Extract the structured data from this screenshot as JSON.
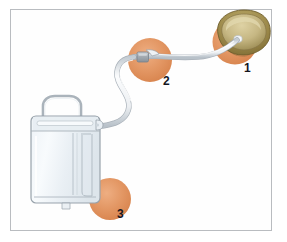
{
  "figure": {
    "background_color": "#ffffff",
    "frame_border_color": "#b9bcc0"
  },
  "labels": [
    {
      "id": "1",
      "text": "1",
      "refers_to": "bladder-with-catheter-balloon"
    },
    {
      "id": "2",
      "text": "2",
      "refers_to": "tubing-connector-clamp"
    },
    {
      "id": "3",
      "text": "3",
      "refers_to": "drainage-bag-outlet-valve"
    }
  ],
  "highlight_circles": [
    {
      "name": "highlight-circle-1",
      "color": "#e08e5c",
      "cx": 235,
      "cy": 42,
      "r": 22
    },
    {
      "name": "highlight-circle-2",
      "color": "#e08e5c",
      "cx": 150,
      "cy": 60,
      "r": 22
    },
    {
      "name": "highlight-circle-3",
      "color": "#e08e5c",
      "cx": 110,
      "cy": 199,
      "r": 21
    }
  ],
  "parts": {
    "bladder": {
      "name": "bladder-organ",
      "fill_outer": "#a08a4e",
      "fill_inner": "#cbbf8e",
      "outline": "#7c6a36"
    },
    "tubing": {
      "name": "drainage-tubing",
      "fill": "#f2f4f6",
      "outline": "#a9b0b7"
    },
    "connector": {
      "name": "tubing-connector-clamp",
      "fill": "#b6bcc2",
      "outline": "#7d858c"
    },
    "bag": {
      "name": "urine-drainage-bag",
      "fill": "#f4f7fa",
      "outline": "#9aa4ad",
      "handle_color": "#b4bcc4"
    }
  }
}
